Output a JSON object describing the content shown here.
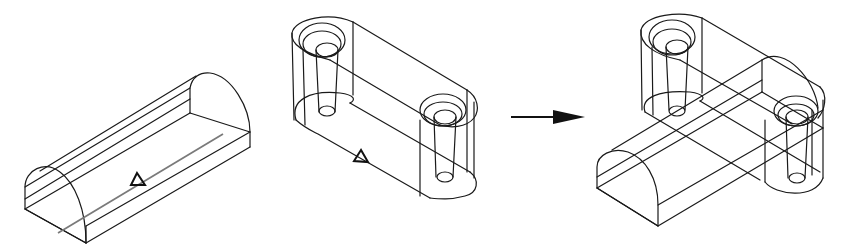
{
  "figure": {
    "operation": "union",
    "operand_a": {
      "label": "half-cylinder block",
      "marker": "triangle",
      "feature_line": "center axis line (gray)"
    },
    "operand_b": {
      "label": "slotted link with two counterbored holes",
      "marker": "triangle",
      "holes": 2
    },
    "arrow": {
      "direction": "right",
      "meaning": "result of operation"
    },
    "result": {
      "label": "combined solid"
    },
    "colors": {
      "line": "#1a1a1a",
      "axis_line": "#7a7a7a",
      "background": "#ffffff"
    }
  }
}
